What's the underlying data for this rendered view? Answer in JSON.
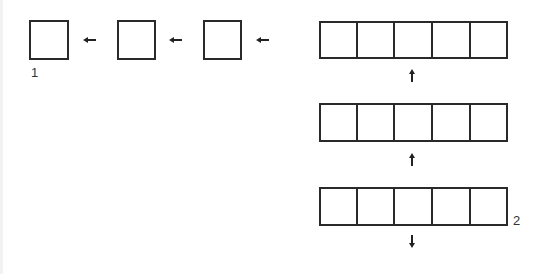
{
  "diagram": {
    "labels": {
      "start": "1",
      "end": "2"
    },
    "single_boxes": [
      {
        "id": "box-1"
      },
      {
        "id": "box-2"
      },
      {
        "id": "box-3"
      }
    ],
    "rows": [
      {
        "id": "row-1",
        "cells": 5
      },
      {
        "id": "row-2",
        "cells": 5
      },
      {
        "id": "row-3",
        "cells": 5
      }
    ],
    "arrows": {
      "horizontal": [
        "left",
        "left",
        "left"
      ],
      "vertical": [
        "up",
        "up",
        "down"
      ]
    },
    "colors": {
      "stroke": "#2a2a2a",
      "background": "#ffffff"
    }
  }
}
